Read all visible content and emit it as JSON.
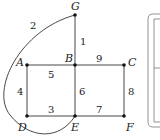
{
  "diagram": {
    "type": "weighted-graph",
    "nodes": [
      {
        "id": "G",
        "label": "G",
        "x": 75,
        "y": 15,
        "lx": 71,
        "ly": 10
      },
      {
        "id": "A",
        "label": "A",
        "x": 27,
        "y": 65,
        "lx": 16,
        "ly": 66
      },
      {
        "id": "B",
        "label": "B",
        "x": 75,
        "y": 65,
        "lx": 65,
        "ly": 62
      },
      {
        "id": "C",
        "label": "C",
        "x": 124,
        "y": 65,
        "lx": 128,
        "ly": 66
      },
      {
        "id": "D",
        "label": "D",
        "x": 27,
        "y": 116,
        "lx": 18,
        "ly": 131
      },
      {
        "id": "E",
        "label": "E",
        "x": 75,
        "y": 116,
        "lx": 71,
        "ly": 131
      },
      {
        "id": "F",
        "label": "F",
        "x": 124,
        "y": 116,
        "lx": 126,
        "ly": 131
      }
    ],
    "edges": [
      {
        "from": "G",
        "to": "B",
        "weight": "1",
        "wx": 80,
        "wy": 45
      },
      {
        "from": "G",
        "to": "E",
        "weight": "2",
        "wx": 30,
        "wy": 29,
        "curved": true
      },
      {
        "from": "D",
        "to": "E",
        "weight": "3",
        "wx": 48,
        "wy": 113
      },
      {
        "from": "A",
        "to": "D",
        "weight": "4",
        "wx": 17,
        "wy": 95
      },
      {
        "from": "A",
        "to": "B",
        "weight": "5",
        "wx": 48,
        "wy": 78
      },
      {
        "from": "B",
        "to": "E",
        "weight": "6",
        "wx": 79,
        "wy": 95
      },
      {
        "from": "E",
        "to": "F",
        "weight": "7",
        "wx": 96,
        "wy": 113
      },
      {
        "from": "C",
        "to": "F",
        "weight": "8",
        "wx": 128,
        "wy": 95
      },
      {
        "from": "B",
        "to": "C",
        "weight": "9",
        "wx": 96,
        "wy": 62
      }
    ]
  }
}
